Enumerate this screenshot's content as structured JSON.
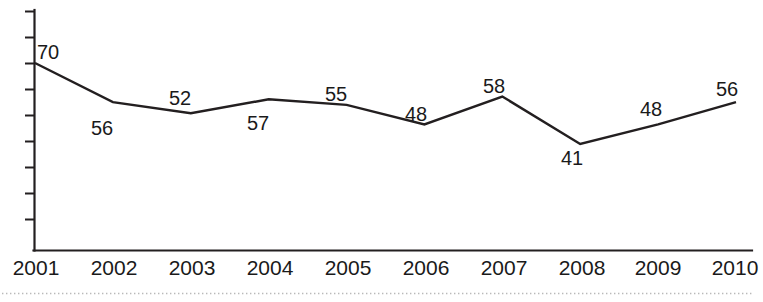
{
  "chart_data": {
    "type": "line",
    "title": "",
    "subtitle": "",
    "xlabel": "",
    "ylabel": "",
    "categories": [
      "2001",
      "2002",
      "2003",
      "2004",
      "2005",
      "2006",
      "2007",
      "2008",
      "2009",
      "2010"
    ],
    "x": [
      2001,
      2002,
      2003,
      2004,
      2005,
      2006,
      2007,
      2008,
      2009,
      2010
    ],
    "values": [
      70,
      56,
      52,
      57,
      55,
      48,
      58,
      41,
      48,
      56
    ],
    "point_labels": [
      "70",
      "56",
      "52",
      "57",
      "55",
      "48",
      "58",
      "41",
      "48",
      "56"
    ],
    "series": [
      {
        "name": "",
        "values": [
          70,
          56,
          52,
          57,
          55,
          48,
          58,
          41,
          48,
          56
        ],
        "color": "#231f20"
      }
    ],
    "ylim": [
      20,
      80
    ],
    "y_tick_count": 9,
    "y_tick_labels": [],
    "grid": false,
    "legend": false,
    "legend_position": "none",
    "annotations": [],
    "colors": {
      "line": "#231f20",
      "axis": "#231f20",
      "text": "#1a1a1a",
      "background": "#ffffff",
      "baseline_dots": "#b9b9b9"
    }
  },
  "axis": {
    "y_ticks_unlabeled": true,
    "x_tick_labels": [
      "2001",
      "2002",
      "2003",
      "2004",
      "2005",
      "2006",
      "2007",
      "2008",
      "2009",
      "2010"
    ]
  },
  "value_labels": {
    "l2001": "70",
    "l2002": "56",
    "l2003": "52",
    "l2004": "57",
    "l2005": "55",
    "l2006": "48",
    "l2007": "58",
    "l2008": "41",
    "l2009": "48",
    "l2010": "56"
  }
}
